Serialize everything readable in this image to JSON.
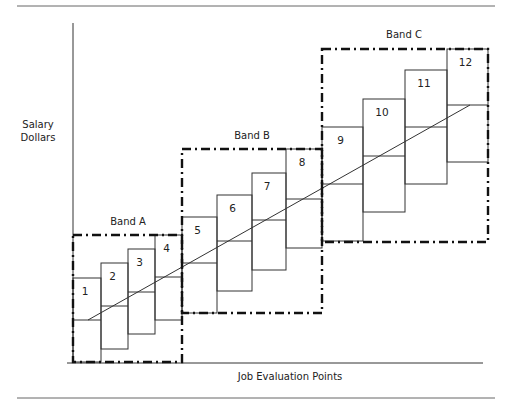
{
  "diagram": {
    "y_axis_label_line1": "Salary",
    "y_axis_label_line2": "Dollars",
    "x_axis_label": "Job Evaluation Points",
    "bands": [
      {
        "label": "Band A",
        "x": 73,
        "y": 235,
        "w": 109,
        "h": 127,
        "label_x": 128,
        "label_y": 225
      },
      {
        "label": "Band B",
        "x": 182,
        "y": 149,
        "w": 140,
        "h": 164,
        "label_x": 252,
        "label_y": 139
      },
      {
        "label": "Band C",
        "x": 322,
        "y": 49,
        "w": 166,
        "h": 193,
        "label_x": 404,
        "label_y": 38
      }
    ],
    "grades": [
      {
        "label": "1",
        "x": 73,
        "y": 278,
        "w": 28,
        "h": 84,
        "mid": 320
      },
      {
        "label": "2",
        "x": 101,
        "y": 263,
        "w": 27,
        "h": 86,
        "mid": 306
      },
      {
        "label": "3",
        "x": 128,
        "y": 249,
        "w": 27,
        "h": 85,
        "mid": 292
      },
      {
        "label": "4",
        "x": 155,
        "y": 235,
        "w": 27,
        "h": 85,
        "mid": 277
      },
      {
        "label": "5",
        "x": 182,
        "y": 217,
        "w": 35,
        "h": 96,
        "mid": 263
      },
      {
        "label": "6",
        "x": 217,
        "y": 195,
        "w": 35,
        "h": 96,
        "mid": 241
      },
      {
        "label": "7",
        "x": 252,
        "y": 173,
        "w": 34,
        "h": 97,
        "mid": 220
      },
      {
        "label": "8",
        "x": 286,
        "y": 149,
        "w": 36,
        "h": 99,
        "mid": 199
      },
      {
        "label": "9",
        "x": 322,
        "y": 127,
        "w": 41,
        "h": 114,
        "mid": 184
      },
      {
        "label": "10",
        "x": 363,
        "y": 99,
        "w": 42,
        "h": 113,
        "mid": 156
      },
      {
        "label": "11",
        "x": 405,
        "y": 70,
        "w": 42,
        "h": 114,
        "mid": 127
      },
      {
        "label": "12",
        "x": 447,
        "y": 49,
        "w": 41,
        "h": 113,
        "mid": 105
      }
    ],
    "trend_line": {
      "x1": 88,
      "y1": 320,
      "x2": 470,
      "y2": 105
    },
    "colors": {
      "line": "#333333",
      "band_border": "#111111",
      "rule": "#666666"
    }
  }
}
